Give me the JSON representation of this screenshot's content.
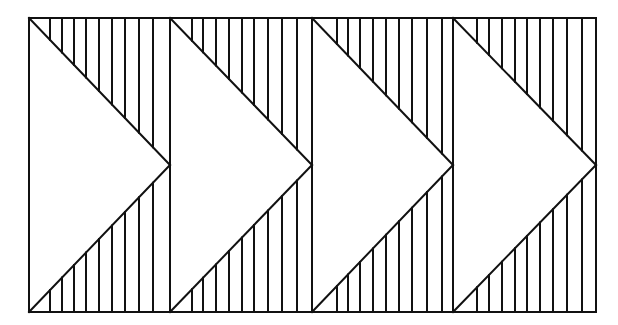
{
  "diagram": {
    "type": "chevron-pattern",
    "stroke_color": "#111111",
    "background": "#ffffff",
    "stroke_width": 2,
    "frame": {
      "x": 29,
      "y": 18,
      "width": 567,
      "height": 294
    },
    "cells": [
      {
        "left": 29,
        "right": 170,
        "hatch_x": [
          50,
          62,
          74,
          86,
          99,
          112,
          125,
          139,
          153
        ]
      },
      {
        "left": 170,
        "right": 312,
        "hatch_x": [
          192,
          203,
          216,
          229,
          242,
          254,
          268,
          282,
          297
        ]
      },
      {
        "left": 312,
        "right": 453,
        "hatch_x": [
          337,
          348,
          360,
          373,
          386,
          399,
          412,
          427,
          442
        ]
      },
      {
        "left": 453,
        "right": 596,
        "hatch_x": [
          477,
          489,
          502,
          515,
          527,
          540,
          553,
          567,
          582
        ]
      }
    ]
  }
}
